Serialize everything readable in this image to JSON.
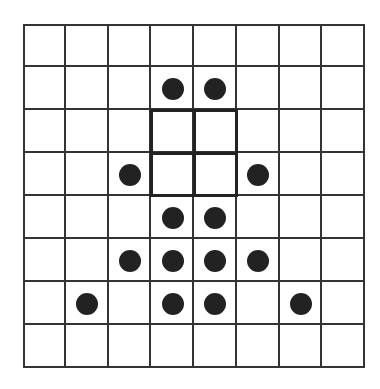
{
  "grid": {
    "rows": 8,
    "cols": 8,
    "line_color": "#333333",
    "background": "#ffffff"
  },
  "highlight_region": {
    "row_start": 2,
    "col_start": 3,
    "rows": 2,
    "cols": 2,
    "border_color": "#222222"
  },
  "dots": [
    {
      "row": 1,
      "col": 3
    },
    {
      "row": 1,
      "col": 4
    },
    {
      "row": 3,
      "col": 2
    },
    {
      "row": 3,
      "col": 5
    },
    {
      "row": 4,
      "col": 3
    },
    {
      "row": 4,
      "col": 4
    },
    {
      "row": 5,
      "col": 2
    },
    {
      "row": 5,
      "col": 3
    },
    {
      "row": 5,
      "col": 4
    },
    {
      "row": 5,
      "col": 5
    },
    {
      "row": 6,
      "col": 1
    },
    {
      "row": 6,
      "col": 3
    },
    {
      "row": 6,
      "col": 4
    },
    {
      "row": 6,
      "col": 6
    }
  ],
  "dot_color": "#222222"
}
